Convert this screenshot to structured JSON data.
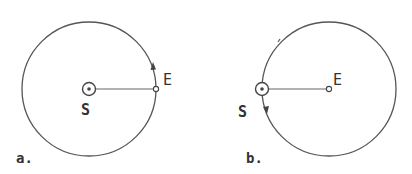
{
  "panels": [
    {
      "id": "a",
      "caption": "a.",
      "sun_label": "S",
      "earth_label": "E",
      "orbit": {
        "cx": 89,
        "cy": 89,
        "r": 67
      },
      "sun": {
        "x": 89,
        "y": 89
      },
      "earth": {
        "x": 156,
        "y": 89
      },
      "arrow": "counterclockwise near E"
    },
    {
      "id": "b",
      "caption": "b.",
      "sun_label": "S",
      "earth_label": "E",
      "orbit": {
        "cx": 329,
        "cy": 89,
        "r": 67
      },
      "sun": {
        "x": 262,
        "y": 89
      },
      "earth": {
        "x": 329,
        "y": 89
      },
      "arrow": "counterclockwise near S"
    }
  ],
  "colors": {
    "stroke": "#555555",
    "text": "#333333",
    "background": "#ffffff"
  }
}
